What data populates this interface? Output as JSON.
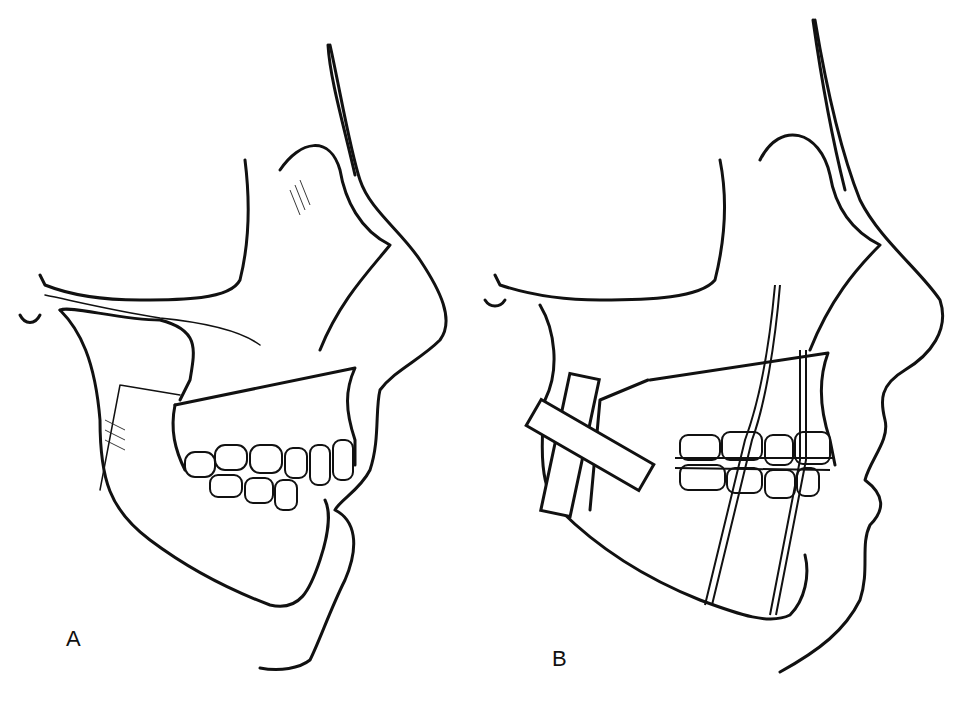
{
  "figure": {
    "panels": [
      {
        "label": "A",
        "content": "Preoperative lateral skull profile showing mandible, maxilla and teeth in malocclusion"
      },
      {
        "label": "B",
        "content": "Postoperative lateral profile with bone plates on mandibular ramus, arch bars with interdental wiring and suspension wires"
      }
    ]
  },
  "colors": {
    "ink": "#111111",
    "background": "#ffffff"
  }
}
